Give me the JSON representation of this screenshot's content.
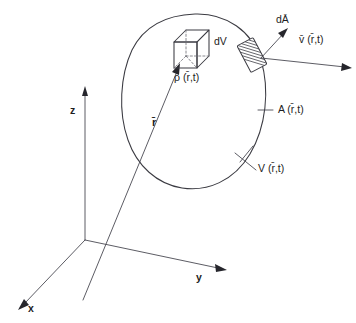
{
  "figure": {
    "background_color": "#ffffff",
    "line_color": "#3b3b42",
    "text_color": "#1d1d22",
    "width": 356,
    "height": 323
  },
  "axes": {
    "z_label": "z",
    "y_label": "y",
    "x_label": "x",
    "origin_label": ""
  },
  "labels": {
    "volume_element": "dV",
    "density": "ρ (r̄,t)",
    "area_element": "dĀ",
    "velocity": "v̄ (r̄,t)",
    "surface": "A (r̄,t)",
    "volume": "V (r̄,t)",
    "position_vector": "r̄"
  },
  "elements": {
    "blob_name": "control-volume-boundary",
    "cube_name": "volume-element-cube",
    "patch_name": "surface-area-element-patch"
  }
}
